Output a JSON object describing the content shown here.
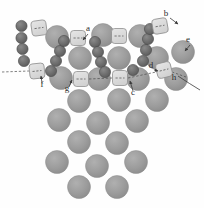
{
  "figure": {
    "name": "surface-adsorbate-model",
    "background": "#fefefe",
    "width": 204,
    "height": 208
  },
  "colors": {
    "substrate": "#9a9a9a",
    "substrate_edge": "#8c8c8c",
    "adatom": "#6e6e6e",
    "adatom_edge": "#4a4a4a",
    "dimer_fill": "#dcdcdc",
    "dimer_edge": "#8f8f8f",
    "dimer_dash": "#6b6b6b",
    "label": "#2b2b2b",
    "leader": "#3a3a3a"
  },
  "labels": [
    {
      "id": "a",
      "text": "a",
      "x": 88,
      "y": 31
    },
    {
      "id": "b",
      "text": "b",
      "x": 166,
      "y": 16
    },
    {
      "id": "c",
      "text": "c",
      "x": 133,
      "y": 95
    },
    {
      "id": "d",
      "text": "d",
      "x": 151,
      "y": 68
    },
    {
      "id": "e",
      "text": "e",
      "x": 188,
      "y": 42
    },
    {
      "id": "f",
      "text": "f",
      "x": 42,
      "y": 87
    },
    {
      "id": "g",
      "text": "g",
      "x": 67,
      "y": 91
    },
    {
      "id": "h",
      "text": "h",
      "x": 174,
      "y": 80
    }
  ],
  "substrate_atoms": [
    {
      "cx": 57,
      "cy": 37,
      "r": 11.5
    },
    {
      "cx": 103,
      "cy": 35,
      "r": 11.5
    },
    {
      "cx": 140,
      "cy": 36,
      "r": 11.5
    },
    {
      "cx": 183,
      "cy": 52,
      "r": 11.5
    },
    {
      "cx": 80,
      "cy": 58,
      "r": 11.5
    },
    {
      "cx": 119,
      "cy": 58,
      "r": 11.5
    },
    {
      "cx": 157,
      "cy": 58,
      "r": 11.5
    },
    {
      "cx": 61,
      "cy": 78,
      "r": 11.5
    },
    {
      "cx": 99,
      "cy": 79,
      "r": 11.5
    },
    {
      "cx": 138,
      "cy": 79,
      "r": 11.5
    },
    {
      "cx": 176,
      "cy": 79,
      "r": 11.5
    },
    {
      "cx": 79,
      "cy": 101,
      "r": 11.5
    },
    {
      "cx": 119,
      "cy": 100,
      "r": 11.5
    },
    {
      "cx": 157,
      "cy": 100,
      "r": 11.5
    },
    {
      "cx": 59,
      "cy": 120,
      "r": 11.5
    },
    {
      "cx": 98,
      "cy": 123,
      "r": 11.5
    },
    {
      "cx": 137,
      "cy": 121,
      "r": 11.5
    },
    {
      "cx": 79,
      "cy": 142,
      "r": 11.5
    },
    {
      "cx": 117,
      "cy": 143,
      "r": 11.5
    },
    {
      "cx": 57,
      "cy": 162,
      "r": 11.5
    },
    {
      "cx": 97,
      "cy": 166,
      "r": 11.5
    },
    {
      "cx": 136,
      "cy": 162,
      "r": 11.5
    },
    {
      "cx": 79,
      "cy": 187,
      "r": 11.5
    },
    {
      "cx": 117,
      "cy": 187,
      "r": 11.5
    }
  ],
  "adatoms": [
    {
      "cx": 21.5,
      "cy": 26,
      "r": 5.6
    },
    {
      "cx": 21.5,
      "cy": 38,
      "r": 5.6
    },
    {
      "cx": 22.5,
      "cy": 49,
      "r": 5.6
    },
    {
      "cx": 24,
      "cy": 61,
      "r": 5.6
    },
    {
      "cx": 51,
      "cy": 71,
      "r": 5.6
    },
    {
      "cx": 56,
      "cy": 61,
      "r": 5.6
    },
    {
      "cx": 60,
      "cy": 51,
      "r": 5.6
    },
    {
      "cx": 64,
      "cy": 41,
      "r": 5.6
    },
    {
      "cx": 95,
      "cy": 42,
      "r": 5.6
    },
    {
      "cx": 98,
      "cy": 52,
      "r": 5.6
    },
    {
      "cx": 101,
      "cy": 62,
      "r": 5.6
    },
    {
      "cx": 105,
      "cy": 72,
      "r": 5.6
    },
    {
      "cx": 133,
      "cy": 70,
      "r": 5.6
    },
    {
      "cx": 143,
      "cy": 61,
      "r": 5.6
    },
    {
      "cx": 146,
      "cy": 50,
      "r": 5.6
    },
    {
      "cx": 148,
      "cy": 39,
      "r": 5.6
    },
    {
      "cx": 150,
      "cy": 29,
      "r": 5.6
    }
  ],
  "dimers": [
    {
      "id": "dimer-upper-left",
      "cx": 39,
      "cy": 28,
      "w": 15,
      "h": 15,
      "rot": -8
    },
    {
      "id": "dimer-a",
      "cx": 78,
      "cy": 38,
      "w": 15,
      "h": 15,
      "rot": 0
    },
    {
      "id": "dimer-mid-top",
      "cx": 119,
      "cy": 36,
      "w": 15,
      "h": 15,
      "rot": 0
    },
    {
      "id": "dimer-b",
      "cx": 160,
      "cy": 26,
      "w": 15,
      "h": 15,
      "rot": -10
    },
    {
      "id": "dimer-f",
      "cx": 37,
      "cy": 71,
      "w": 15,
      "h": 15,
      "rot": -6
    },
    {
      "id": "dimer-g",
      "cx": 81,
      "cy": 79,
      "w": 15,
      "h": 15,
      "rot": 0
    },
    {
      "id": "dimer-c",
      "cx": 120,
      "cy": 78,
      "w": 15,
      "h": 15,
      "rot": 0
    },
    {
      "id": "dimer-d",
      "cx": 164,
      "cy": 70,
      "w": 15,
      "h": 15,
      "rot": -14
    }
  ],
  "leaders": [
    {
      "id": "leader-a",
      "d": "M 88 34 L 83 40",
      "arrow": true
    },
    {
      "id": "leader-b",
      "d": "M 170 18 L 178 24",
      "arrow": true
    },
    {
      "id": "leader-c",
      "d": "M 133 91 L 130 81",
      "arrow": true
    },
    {
      "id": "leader-d",
      "d": "M 154 70 L 158 71",
      "arrow": true
    },
    {
      "id": "leader-e",
      "d": "M 190 45 L 185 51",
      "arrow": true
    },
    {
      "id": "leader-f",
      "d": "M 42 83 L 41 76",
      "arrow": true
    },
    {
      "id": "leader-g",
      "d": "M 69 87 L 72 80",
      "arrow": true
    },
    {
      "id": "leader-h",
      "d": "M 178 76 Q 190 84 200 90",
      "arrow": false
    }
  ],
  "connector_lines": [
    {
      "id": "connector-left-edge",
      "d": "M 2 72 L 29 71"
    },
    {
      "id": "connector-g-to-c",
      "d": "M 89 79 L 112 78"
    },
    {
      "id": "connector-c-to-d",
      "d": "M 128 78 L 156 72"
    },
    {
      "id": "connector-h-tail",
      "d": "M 172 72 L 186 77"
    }
  ]
}
